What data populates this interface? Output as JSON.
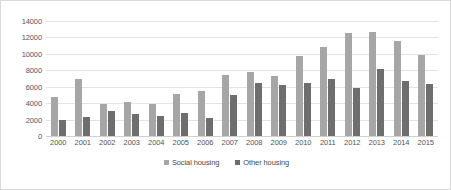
{
  "chart_data": {
    "type": "bar",
    "title": "",
    "subtitle": "",
    "xlabel": "",
    "ylabel": "",
    "ylim": [
      0,
      14000
    ],
    "y_ticks": [
      0,
      2000,
      4000,
      6000,
      8000,
      10000,
      12000,
      14000
    ],
    "y_tick_labels": [
      "0",
      "2000",
      "4000",
      "6000",
      "8000",
      "10000",
      "12000",
      "14000"
    ],
    "grid": true,
    "legend_position": "bottom",
    "categories": [
      "2000",
      "2001",
      "2002",
      "2003",
      "2004",
      "2005",
      "2006",
      "2007",
      "2008",
      "2009",
      "2010",
      "2011",
      "2012",
      "2013",
      "2014",
      "2015"
    ],
    "series": [
      {
        "name": "Social housing",
        "color": "#a6a6a6",
        "values": [
          4800,
          7000,
          3850,
          4200,
          3950,
          5100,
          5500,
          7400,
          7850,
          7300,
          9700,
          10800,
          12500,
          12700,
          11550,
          9900
        ]
      },
      {
        "name": "Other housing",
        "color": "#6e6e6e",
        "values": [
          1900,
          2350,
          3050,
          2650,
          2450,
          2800,
          2200,
          5050,
          6400,
          6250,
          6450,
          6900,
          5850,
          8100,
          6700,
          6300
        ]
      }
    ]
  },
  "colors": {
    "background": "#ffffff",
    "border": "#d9d9d9",
    "gridline": "#e3e3e3",
    "axis_text": "#555555",
    "legend_text": "#4a4a4a"
  }
}
